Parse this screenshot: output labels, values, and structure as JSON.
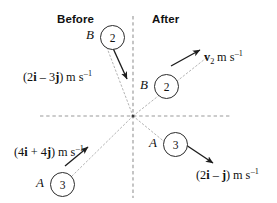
{
  "figure": {
    "headers": {
      "before": "Before",
      "after": "After"
    },
    "background_color": "#ffffff",
    "ink_color": "#111111",
    "axis_color": "#8c8c8c"
  },
  "axes": {
    "origin": {
      "x": 133,
      "y": 116
    },
    "horizontal": {
      "x1": 40,
      "y1": 116,
      "x2": 231,
      "y2": 116,
      "style": "dashed"
    },
    "vertical": {
      "x1": 133,
      "y1": 16,
      "x2": 133,
      "y2": 198,
      "style": "dashed"
    }
  },
  "trajectories": [
    {
      "name": "B-incoming-path",
      "x1": 104,
      "y1": 40,
      "x2": 133,
      "y2": 116,
      "style": "dotted"
    },
    {
      "name": "B-outgoing-path",
      "x1": 133,
      "y1": 116,
      "x2": 210,
      "y2": 55,
      "style": "dotted"
    },
    {
      "name": "A-incoming-path",
      "x1": 72,
      "y1": 176,
      "x2": 133,
      "y2": 116,
      "style": "dotted"
    },
    {
      "name": "A-outgoing-path",
      "x1": 133,
      "y1": 116,
      "x2": 172,
      "y2": 148,
      "style": "dotted"
    }
  ],
  "particles": [
    {
      "id": "b-before",
      "label": "B",
      "mass": "2",
      "label_x": 86,
      "label_y": 27,
      "circle_x": 100,
      "circle_y": 25,
      "region": "before"
    },
    {
      "id": "a-before",
      "label": "A",
      "mass": "3",
      "label_x": 36,
      "label_y": 175,
      "circle_x": 50,
      "circle_y": 172,
      "region": "before"
    },
    {
      "id": "b-after",
      "label": "B",
      "mass": "2",
      "label_x": 140,
      "label_y": 77,
      "circle_x": 154,
      "circle_y": 74,
      "region": "after"
    },
    {
      "id": "a-after",
      "label": "A",
      "mass": "3",
      "label_x": 149,
      "label_y": 135,
      "circle_x": 163,
      "circle_y": 132,
      "region": "after"
    }
  ],
  "arrows": [
    {
      "name": "b-before-velocity-arrow",
      "x1": 112,
      "y1": 46,
      "x2": 127,
      "y2": 79
    },
    {
      "name": "a-before-velocity-arrow",
      "x1": 65,
      "y1": 166,
      "x2": 88,
      "y2": 147
    },
    {
      "name": "b-after-velocity-arrow",
      "x1": 171,
      "y1": 66,
      "x2": 200,
      "y2": 50
    },
    {
      "name": "a-after-velocity-arrow",
      "x1": 183,
      "y1": 143,
      "x2": 213,
      "y2": 163
    }
  ],
  "velocity_labels": [
    {
      "id": "b-before-velocity",
      "x": 23,
      "y": 70,
      "open": "(2",
      "i": "i",
      "op": " – 3",
      "j": "j",
      "close": ")",
      "unit_m": "m",
      "unit_s": "s",
      "unit_exp": "–1"
    },
    {
      "id": "a-before-velocity",
      "x": 14,
      "y": 145,
      "open": "(4",
      "i": "i",
      "op": " + 4",
      "j": "j",
      "close": ")",
      "unit_m": "m",
      "unit_s": "s",
      "unit_exp": "–1"
    },
    {
      "id": "a-after-velocity",
      "x": 196,
      "y": 168,
      "open": "(2",
      "i": "i",
      "op": " – ",
      "j": "j",
      "close": ")",
      "unit_m": "m",
      "unit_s": "s",
      "unit_exp": "–1"
    }
  ],
  "unknown_velocity_label": {
    "id": "b-after-velocity",
    "x": 204,
    "y": 50,
    "symbol": "v",
    "subscript": "2",
    "unit_m": "m",
    "unit_s": "s",
    "unit_exp": "–1"
  }
}
